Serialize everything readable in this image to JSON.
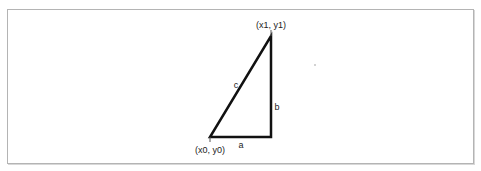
{
  "diagram": {
    "type": "right-triangle",
    "vertices": {
      "start": {
        "label": "(x0, y0)",
        "x": 210,
        "y": 137
      },
      "corner": {
        "x": 271,
        "y": 137
      },
      "end": {
        "label": "(x1, y1)",
        "x": 271,
        "y": 36
      }
    },
    "sides": {
      "hypotenuse": "c",
      "vertical": "b",
      "horizontal": "a"
    },
    "colors": {
      "stroke": "#111111",
      "border": "#b4b4b4",
      "background": "#ffffff"
    }
  }
}
